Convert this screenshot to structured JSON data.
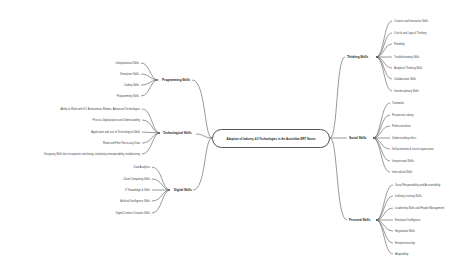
{
  "central": {
    "label": "Adoption of Industry 4.0 Technologies in the Australian ERT Sector"
  },
  "right_branches": [
    {
      "label": "Thinking Skills",
      "children": [
        "Creative and Innovative Skills",
        "Critical and Logical Thinking",
        "Flexibility",
        "Troubleshooting Skills",
        "Analytical Thinking Skills",
        "Collaboration Skills",
        "Interdisciplinary Skills"
      ]
    },
    {
      "label": "Social Skills",
      "children": [
        "Teamwork",
        "Perspective-taking",
        "Professionalism",
        "Understanding ethics",
        "Self-promotion & social organisation",
        "Interpersonal Skills",
        "Intercultural Skills"
      ]
    },
    {
      "label": "Personal Skills",
      "children": [
        "Social Responsibility and Accountability",
        "Lifelong Learning Skills",
        "Leadership Skills and People Management",
        "Emotional Intelligence",
        "Negotiation Skills",
        "Entrepreneurship",
        "Adaptability"
      ]
    }
  ],
  "left_branches": [
    {
      "label": "Programming Skills",
      "children": [
        "Computational Skills",
        "Simulation Skills",
        "Coding Skills",
        "Programming Skills"
      ]
    },
    {
      "label": "Technological Skills",
      "children": [
        "Ability to Work with IoT, Autonomous Robots, Advanced Technologies",
        "Process Digitalization and Understanding",
        "Application and use of Technological Skills",
        "Read and Filter Necessary Data",
        "Designing Skills that incorporate simulating, simulating interoperability, modularising"
      ]
    },
    {
      "label": "Digital Skills",
      "children": [
        "Data Analytics",
        "Cloud Computing Skills",
        "IT Knowledge & Skills",
        "Artificial Intelligence Skills",
        "Digital Content Creation Skills"
      ]
    }
  ]
}
